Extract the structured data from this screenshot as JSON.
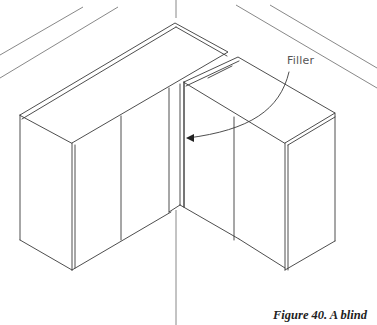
{
  "figure": {
    "callout_label": "Filler",
    "caption": "Figure 40.  A blind"
  },
  "colors": {
    "line": "#3a3a3a",
    "wall_line": "#6a6a6a",
    "background": "#ffffff"
  }
}
